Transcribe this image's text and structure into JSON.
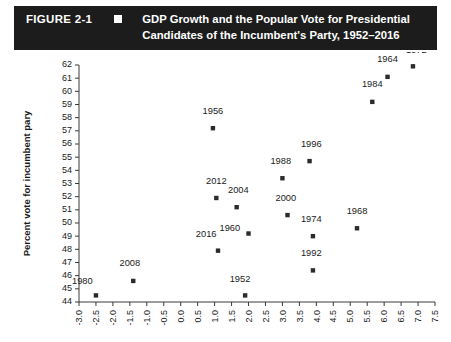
{
  "header": {
    "figure_number": "FIGURE 2-1",
    "bullet_icon": "filled-square-icon",
    "title_line1": "GDP Growth and the Popular Vote for Presidential",
    "title_line2": "Candidates of the Incumbent's Party, 1952–2016",
    "background_color": "#1c1c1c",
    "text_color": "#ffffff"
  },
  "chart_data": {
    "type": "scatter",
    "xlabel": "",
    "ylabel": "Percent vote for incumbent pary",
    "xlim": [
      -3.0,
      7.5
    ],
    "ylim": [
      44,
      62
    ],
    "grid": false,
    "legend": false,
    "marker_color": "#2b2b2b",
    "marker_shape": "square",
    "xticks": [
      "-3.0",
      "-2.5",
      "-2.0",
      "-1.5",
      "-1.0",
      "-0.5",
      "0.0",
      "0.5",
      "1.0",
      "1.5",
      "2.0",
      "2.5",
      "3.0",
      "3.5",
      "4.0",
      "4.5",
      "5.0",
      "5.5",
      "6.0",
      "6.5",
      "7.0",
      "7.5"
    ],
    "yticks": [
      "44",
      "45",
      "46",
      "47",
      "48",
      "49",
      "50",
      "51",
      "52",
      "53",
      "54",
      "55",
      "56",
      "57",
      "58",
      "59",
      "60",
      "61",
      "62"
    ],
    "points": [
      {
        "label": "1980",
        "x": -2.5,
        "y": 44.5,
        "lx": -2.9,
        "ly": 45.4
      },
      {
        "label": "2008",
        "x": -1.4,
        "y": 45.6,
        "lx": -1.5,
        "ly": 46.7
      },
      {
        "label": "1952",
        "x": 1.9,
        "y": 44.5,
        "lx": 1.75,
        "ly": 45.5
      },
      {
        "label": "2016",
        "x": 1.1,
        "y": 47.9,
        "lx": 0.75,
        "ly": 48.9
      },
      {
        "label": "1956",
        "x": 0.95,
        "y": 57.2,
        "lx": 0.95,
        "ly": 58.3
      },
      {
        "label": "2012",
        "x": 1.05,
        "y": 51.9,
        "lx": 1.05,
        "ly": 53.0
      },
      {
        "label": "2004",
        "x": 1.65,
        "y": 51.2,
        "lx": 1.7,
        "ly": 52.3
      },
      {
        "label": "1960",
        "x": 2.0,
        "y": 49.2,
        "lx": 1.45,
        "ly": 49.4
      },
      {
        "label": "2000",
        "x": 3.15,
        "y": 50.6,
        "lx": 3.1,
        "ly": 51.7
      },
      {
        "label": "1988",
        "x": 3.0,
        "y": 53.4,
        "lx": 2.95,
        "ly": 54.5
      },
      {
        "label": "1996",
        "x": 3.8,
        "y": 54.7,
        "lx": 3.85,
        "ly": 55.8
      },
      {
        "label": "1974",
        "x": 3.9,
        "y": 49.0,
        "lx": 3.85,
        "ly": 50.1
      },
      {
        "label": "1992",
        "x": 3.9,
        "y": 46.4,
        "lx": 3.85,
        "ly": 47.5
      },
      {
        "label": "1968",
        "x": 5.2,
        "y": 49.6,
        "lx": 5.2,
        "ly": 50.7
      },
      {
        "label": "1984",
        "x": 5.65,
        "y": 59.2,
        "lx": 5.65,
        "ly": 60.3
      },
      {
        "label": "1964",
        "x": 6.1,
        "y": 61.1,
        "lx": 6.1,
        "ly": 62.2
      },
      {
        "label": "1972",
        "x": 6.85,
        "y": 61.9,
        "lx": 6.95,
        "ly": 62.9
      }
    ]
  }
}
